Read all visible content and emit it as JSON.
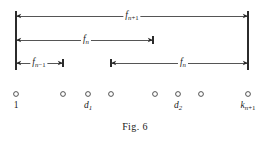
{
  "figure": {
    "caption": "Fig. 6",
    "caption_y": 121,
    "width": 270,
    "height": 141,
    "stroke_color": "#2b2b2b",
    "background_color": "#ffffff"
  },
  "measures": [
    {
      "id": "f-n-plus-1",
      "name": "span-fn-plus-1",
      "label_main": "f",
      "label_sub": "n",
      "label_op": "+1",
      "y": 16,
      "x_start": 16,
      "x_end": 248,
      "label_x": 132,
      "arrow_start": true,
      "arrow_end": true,
      "tick_start": false,
      "tick_end": false
    },
    {
      "id": "f-n-upper",
      "name": "span-fn-upper",
      "label_main": "f",
      "label_sub": "n",
      "label_op": "",
      "y": 40,
      "x_start": 16,
      "x_end": 153,
      "label_x": 86,
      "arrow_start": true,
      "arrow_end": true,
      "tick_start": false,
      "tick_end": true
    },
    {
      "id": "f-n-minus-1",
      "name": "span-fn-minus-1",
      "label_main": "f",
      "label_sub": "n",
      "label_op": "−1",
      "y": 63,
      "x_start": 16,
      "x_end": 63,
      "label_x": 39,
      "arrow_start": true,
      "arrow_end": true,
      "tick_start": false,
      "tick_end": true
    },
    {
      "id": "f-n-lower",
      "name": "span-fn-lower",
      "label_main": "f",
      "label_sub": "n",
      "label_op": "",
      "y": 63,
      "x_start": 111,
      "x_end": 248,
      "label_x": 183,
      "arrow_start": true,
      "arrow_end": true,
      "tick_start": true,
      "tick_end": false
    }
  ],
  "verticals": [
    {
      "id": "left-rule",
      "name": "vertical-rule-left",
      "x": 16,
      "y_top": 11,
      "y_bottom": 70
    },
    {
      "id": "right-rule",
      "name": "vertical-rule-right",
      "x": 248,
      "y_top": 11,
      "y_bottom": 70
    }
  ],
  "axis": {
    "node_y": 94,
    "node_radius": 2.4,
    "label_y": 101,
    "nodes": [
      {
        "id": "n1",
        "name": "node-1",
        "x": 16,
        "label_main": "1",
        "label_sub": "",
        "label_op": "",
        "plain": true,
        "labeled": true
      },
      {
        "id": "n2",
        "name": "node-2",
        "x": 63,
        "label_main": "",
        "label_sub": "",
        "label_op": "",
        "plain": false,
        "labeled": false
      },
      {
        "id": "n3",
        "name": "node-d1",
        "x": 88,
        "label_main": "d",
        "label_sub": "1",
        "label_op": "",
        "plain": false,
        "labeled": true
      },
      {
        "id": "n4",
        "name": "node-4",
        "x": 111,
        "label_main": "",
        "label_sub": "",
        "label_op": "",
        "plain": false,
        "labeled": false
      },
      {
        "id": "n5",
        "name": "node-5",
        "x": 155,
        "label_main": "",
        "label_sub": "",
        "label_op": "",
        "plain": false,
        "labeled": false
      },
      {
        "id": "n6",
        "name": "node-d2",
        "x": 178,
        "label_main": "d",
        "label_sub": "2",
        "label_op": "",
        "plain": false,
        "labeled": true
      },
      {
        "id": "n7",
        "name": "node-7",
        "x": 201,
        "label_main": "",
        "label_sub": "",
        "label_op": "",
        "plain": false,
        "labeled": false
      },
      {
        "id": "n8",
        "name": "node-k-n-plus-1",
        "x": 248,
        "label_main": "k",
        "label_sub": "n",
        "label_op": "+1",
        "plain": false,
        "labeled": true
      }
    ]
  }
}
